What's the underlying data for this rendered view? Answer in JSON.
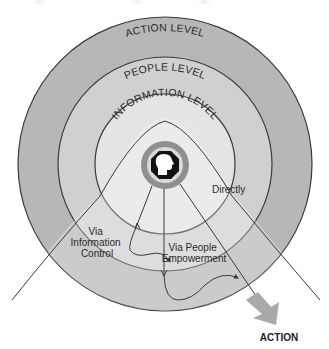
{
  "diagram": {
    "type": "concentric-levels",
    "rings": [
      {
        "id": "action",
        "label": "ACTION LEVEL",
        "color": "#b7b7b7"
      },
      {
        "id": "people",
        "label": "PEOPLE LEVEL",
        "color": "#d0d0d0"
      },
      {
        "id": "information",
        "label": "INFORMATION LEVEL",
        "color": "#e4e4e4"
      }
    ],
    "center": {
      "icon": "head-profile-icon",
      "ring_color": "#8f8f8f"
    },
    "paths": [
      {
        "id": "directly",
        "label": "Directly"
      },
      {
        "id": "via-information-control",
        "label_lines": [
          "Via",
          "Information",
          "Control"
        ]
      },
      {
        "id": "via-people-empowerment",
        "label_lines": [
          "Via People",
          "Empowerment"
        ]
      }
    ],
    "output": {
      "label": "ACTION",
      "arrow_color": "#a9a9a9"
    },
    "line_color": "#3a3a3a"
  }
}
